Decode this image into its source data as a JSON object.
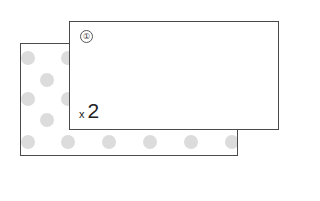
{
  "diagram": {
    "back_card": {
      "pattern": "polka-dot",
      "dot_color": "#dcdcdc",
      "border_color": "#4a4a4a"
    },
    "front_card": {
      "index_marker": "①",
      "quantity_prefix": "x",
      "quantity_value": "2",
      "border_color": "#4a4a4a"
    }
  }
}
